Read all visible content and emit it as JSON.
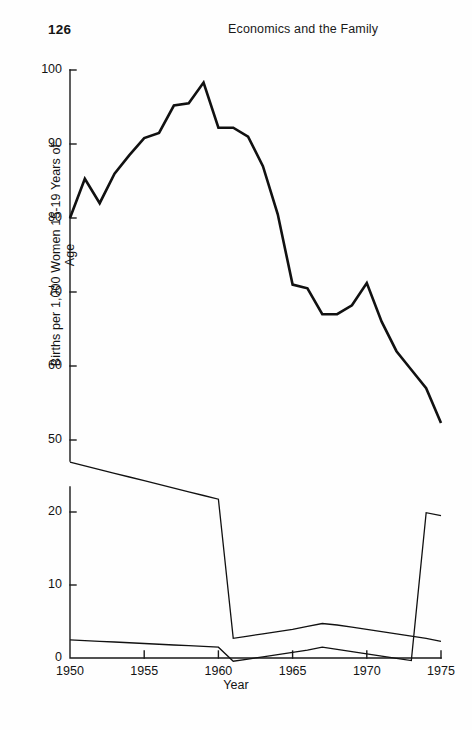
{
  "page": {
    "number": "126",
    "running_head": "Economics and the Family"
  },
  "chart_data": {
    "type": "line",
    "title": "",
    "subtitle": "",
    "xlabel": "Year",
    "ylabel": "Births per 1,000 Women 15-19 Years of Age",
    "grid": false,
    "legend": "none",
    "xlim": [
      1950,
      1975
    ],
    "ylim": [
      0,
      100
    ],
    "y_axis_break": {
      "present": true,
      "between": [
        20,
        50
      ]
    },
    "xticks": [
      1950,
      1955,
      1960,
      1965,
      1970,
      1975
    ],
    "xtick_labels": [
      "1950",
      "1955",
      "1960",
      "1965",
      "1970",
      "1975"
    ],
    "yticks": [
      0,
      10,
      20,
      50,
      60,
      70,
      80,
      90,
      100
    ],
    "ytick_labels": [
      "0",
      "10",
      "20",
      "50",
      "60",
      "70",
      "80",
      "90",
      "100"
    ],
    "x": [
      1950,
      1951,
      1952,
      1953,
      1954,
      1955,
      1956,
      1957,
      1958,
      1959,
      1960,
      1961,
      1962,
      1963,
      1964,
      1965,
      1966,
      1967,
      1968,
      1969,
      1970,
      1971,
      1972,
      1973,
      1974,
      1975
    ],
    "series": [
      {
        "name": "upper-curve",
        "values": [
          80.0,
          85.3,
          82.0,
          86.0,
          88.5,
          90.8,
          91.5,
          95.2,
          95.5,
          98.3,
          92.2,
          92.2,
          91.0,
          87.0,
          80.5,
          71.0,
          70.5,
          67.0,
          67.0,
          68.2,
          71.2,
          66.0,
          62.0,
          59.5,
          57.0,
          52.3
        ]
      },
      {
        "name": "middle-curve",
        "values": [
          47.0,
          46.5,
          46.0,
          45.5,
          45.0,
          44.5,
          44.0,
          43.5,
          43.0,
          42.5,
          42.0,
          23.2,
          23.5,
          23.8,
          24.1,
          24.4,
          24.8,
          25.2,
          25.0,
          24.7,
          24.4,
          24.1,
          23.8,
          23.5,
          23.2,
          22.8
        ]
      },
      {
        "name": "lower-curve",
        "values": [
          23.0,
          22.9,
          22.8,
          22.7,
          22.6,
          22.5,
          22.4,
          22.3,
          22.2,
          22.1,
          22.0,
          20.1,
          20.4,
          20.7,
          21.0,
          21.3,
          21.6,
          22.0,
          21.7,
          21.4,
          21.1,
          20.8,
          20.5,
          20.2,
          19.9,
          19.5
        ]
      }
    ]
  }
}
